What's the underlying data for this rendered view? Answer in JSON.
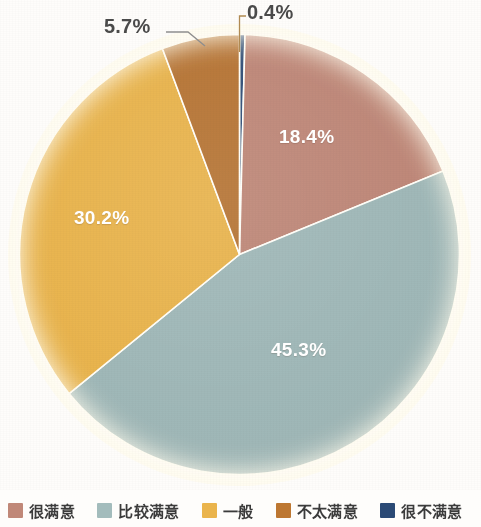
{
  "chart_data": {
    "type": "pie",
    "title": "",
    "subtitle": "",
    "xlabel": "",
    "ylabel": "",
    "legend_position": "bottom",
    "grid": false,
    "start_angle_deg": 0,
    "direction": "clockwise",
    "categories": [
      "很不满意",
      "很满意",
      "比较满意",
      "一般",
      "不太满意"
    ],
    "values": [
      0.4,
      18.4,
      45.3,
      30.2,
      5.7
    ],
    "unit": "%",
    "slices": [
      {
        "label": "很不满意",
        "value": 0.4,
        "display": "0.4%",
        "color": "#2b4a75",
        "label_placement": "outside"
      },
      {
        "label": "很满意",
        "value": 18.4,
        "display": "18.4%",
        "color": "#bd8373",
        "label_placement": "inside"
      },
      {
        "label": "比较满意",
        "value": 45.3,
        "display": "45.3%",
        "color": "#9bb4b4",
        "label_placement": "inside"
      },
      {
        "label": "一般",
        "value": 30.2,
        "display": "30.2%",
        "color": "#e8b044",
        "label_placement": "inside"
      },
      {
        "label": "不太满意",
        "value": 5.7,
        "display": "5.7%",
        "color": "#b5702e",
        "label_placement": "outside"
      }
    ]
  },
  "labels": {
    "inside": [
      {
        "text": "18.4%"
      },
      {
        "text": "45.3%"
      },
      {
        "text": "30.2%"
      }
    ],
    "outside": [
      {
        "text": "0.4%"
      },
      {
        "text": "5.7%"
      }
    ]
  },
  "legend": {
    "items": [
      {
        "label": "很满意",
        "color": "#c08878"
      },
      {
        "label": "比较满意",
        "color": "#a3bcbc"
      },
      {
        "label": "一般",
        "color": "#eab44c"
      },
      {
        "label": "不太满意",
        "color": "#bd7731"
      },
      {
        "label": "很不满意",
        "color": "#2b4a75"
      }
    ]
  },
  "colors": {
    "very_satisfied": "#bd8373",
    "fairly_satisfied": "#9bb4b4",
    "average": "#e8b044",
    "not_very_satisfied": "#b5702e",
    "very_unsatisfied": "#2b4a75",
    "background": "#fefdfb",
    "separator": "#ffffff",
    "label_text": "#4a4a4a",
    "inside_label_text": "#ffffff"
  }
}
